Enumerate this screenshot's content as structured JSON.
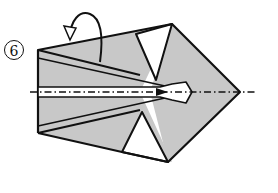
{
  "diagram": {
    "type": "origami-step",
    "step_number": "6",
    "colors": {
      "paper_shaded": "#c8c8c8",
      "paper_white": "#ffffff",
      "line": "#111111"
    },
    "annotations": {
      "arrow": "curved fold-behind arrow (mountain fold)",
      "center_line": "dash-dot mountain fold line along horizontal axis"
    }
  }
}
